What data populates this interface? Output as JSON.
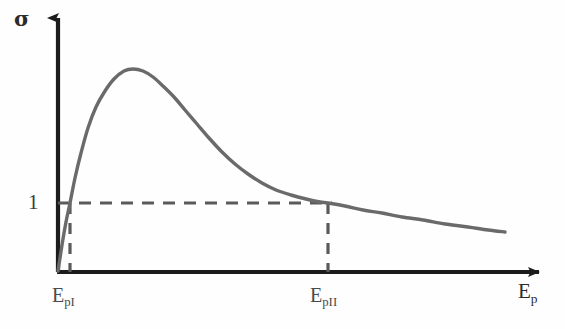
{
  "figure": {
    "name": "secondary-electron-emission-yield-curve",
    "background_color": "#fefefe"
  },
  "axes": {
    "y_axis": {
      "label": "σ",
      "icon": "up-arrow-axis",
      "color": "#1c1c1c",
      "x_px": 58,
      "base_y_px": 272,
      "tip_y_px": 10
    },
    "x_axis": {
      "label": "E_p",
      "label_base": "E",
      "label_sub": "p",
      "icon": "right-arrow-axis",
      "color": "#1c1c1c",
      "y_px": 272,
      "base_x_px": 58,
      "tip_x_px": 551
    },
    "y_ticks": [
      {
        "label": "1",
        "value": 1,
        "y_px": 203
      }
    ],
    "x_ticks": [
      {
        "label_base": "E",
        "label_sub": "pI",
        "x_px": 70
      },
      {
        "label_base": "E",
        "label_sub": "pII",
        "x_px": 328
      }
    ]
  },
  "guides": {
    "color": "#5a5a5a",
    "dash_pattern": "11 9",
    "horizontal": {
      "name": "unity-yield-guide",
      "y_px": 203,
      "x_start_px": 58,
      "x_end_px": 332
    },
    "verticals": [
      {
        "name": "epi-guide",
        "x_px": 70,
        "y_top_px": 203,
        "y_bottom_px": 272
      },
      {
        "name": "epii-guide",
        "x_px": 328,
        "y_top_px": 203,
        "y_bottom_px": 272
      }
    ]
  },
  "chart_data": {
    "type": "line",
    "title": "",
    "xlabel": "E_p",
    "ylabel": "σ",
    "grid": false,
    "legend": null,
    "series": [
      {
        "name": "secondary-electron-yield",
        "color": "#6a6a6a",
        "line_width": 3.4,
        "annotations": [
          {
            "label": "peak",
            "x_px": 133,
            "y_px": 70
          },
          {
            "label": "first crossover E_pI",
            "x_px": 70,
            "y_px": 203
          },
          {
            "label": "second crossover E_pII",
            "x_px": 328,
            "y_px": 203
          }
        ],
        "points_px": [
          [
            58,
            271
          ],
          [
            62,
            245
          ],
          [
            66,
            222
          ],
          [
            70,
            203
          ],
          [
            75,
            178
          ],
          [
            81,
            153
          ],
          [
            88,
            128
          ],
          [
            96,
            107
          ],
          [
            105,
            91
          ],
          [
            114,
            79
          ],
          [
            124,
            71
          ],
          [
            133,
            69
          ],
          [
            143,
            71
          ],
          [
            153,
            77
          ],
          [
            163,
            86
          ],
          [
            174,
            97
          ],
          [
            185,
            110
          ],
          [
            197,
            124
          ],
          [
            209,
            138
          ],
          [
            222,
            152
          ],
          [
            235,
            164
          ],
          [
            248,
            174
          ],
          [
            262,
            183
          ],
          [
            276,
            190
          ],
          [
            291,
            195
          ],
          [
            306,
            199
          ],
          [
            320,
            202
          ],
          [
            328,
            203
          ],
          [
            345,
            206
          ],
          [
            363,
            210
          ],
          [
            382,
            213
          ],
          [
            402,
            217
          ],
          [
            423,
            220
          ],
          [
            445,
            224
          ],
          [
            468,
            227
          ],
          [
            488,
            230
          ],
          [
            505,
            232
          ]
        ]
      }
    ],
    "xlim_px": [
      58,
      551
    ],
    "ylim_px": [
      272,
      10
    ]
  }
}
